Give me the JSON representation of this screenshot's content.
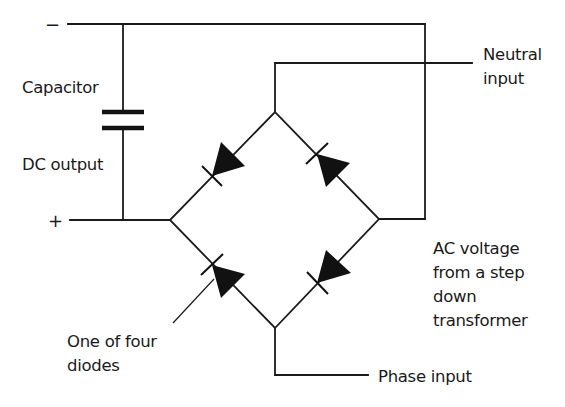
{
  "diagram": {
    "labels": {
      "minus": "−",
      "plus": "+",
      "capacitor": "Capacitor",
      "dc_output": "DC output",
      "neutral_input": [
        "Neutral",
        "input"
      ],
      "ac_voltage": [
        "AC voltage",
        "from a step",
        "down",
        "transformer"
      ],
      "one_of_four_diodes": [
        "One of four",
        "diodes"
      ],
      "phase_input": "Phase input"
    },
    "components": [
      {
        "type": "capacitor",
        "name": "Capacitor"
      },
      {
        "type": "diode",
        "position": "upper-left"
      },
      {
        "type": "diode",
        "position": "upper-right"
      },
      {
        "type": "diode",
        "position": "lower-left"
      },
      {
        "type": "diode",
        "position": "lower-right"
      }
    ],
    "colors": {
      "line": "#1a1a1a",
      "background": "#ffffff"
    }
  }
}
